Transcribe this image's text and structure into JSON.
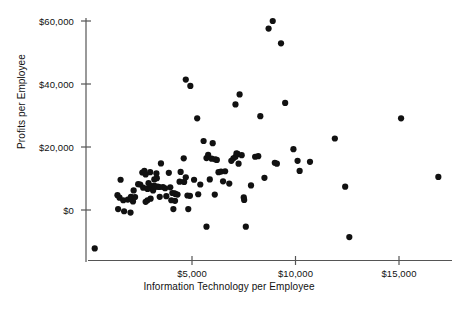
{
  "chart_data": {
    "type": "scatter",
    "title": "",
    "xlabel": "Information Technology per Employee",
    "ylabel": "Profits per Employee",
    "xlim": [
      0,
      18000
    ],
    "ylim": [
      -14000,
      64000
    ],
    "grid": false,
    "legend": null,
    "marker": {
      "shape": "circle",
      "color": "#111111",
      "size": 4.2
    },
    "xticks": [
      5000,
      10000,
      15000
    ],
    "xticklabels": [
      "$5,000",
      "$10,000",
      "$15,000"
    ],
    "yticks": [
      0,
      20000,
      40000,
      60000
    ],
    "yticklabels": [
      "$0",
      "$20,000",
      "$40,000",
      "$60,000"
    ],
    "n_points": 108,
    "points": [
      [
        300,
        -12200
      ],
      [
        1550,
        9600
      ],
      [
        1400,
        4700
      ],
      [
        1500,
        3900
      ],
      [
        1680,
        3100
      ],
      [
        1430,
        300
      ],
      [
        1720,
        -400
      ],
      [
        2030,
        -800
      ],
      [
        1900,
        3300
      ],
      [
        2150,
        2700
      ],
      [
        2180,
        6200
      ],
      [
        2600,
        11900
      ],
      [
        2700,
        12400
      ],
      [
        2760,
        11300
      ],
      [
        2400,
        8200
      ],
      [
        2500,
        8100
      ],
      [
        2640,
        7100
      ],
      [
        2850,
        6700
      ],
      [
        2980,
        6900
      ],
      [
        3050,
        7600
      ],
      [
        3180,
        7700
      ],
      [
        3120,
        6200
      ],
      [
        3000,
        3600
      ],
      [
        2850,
        3100
      ],
      [
        2760,
        2600
      ],
      [
        3180,
        9700
      ],
      [
        3300,
        10100
      ],
      [
        3240,
        7400
      ],
      [
        3350,
        7400
      ],
      [
        3420,
        7300
      ],
      [
        3500,
        14800
      ],
      [
        3600,
        7300
      ],
      [
        3700,
        6900
      ],
      [
        3880,
        11800
      ],
      [
        3950,
        7200
      ],
      [
        4050,
        5400
      ],
      [
        4150,
        5300
      ],
      [
        4200,
        5100
      ],
      [
        4300,
        4900
      ],
      [
        4180,
        2900
      ],
      [
        4000,
        3100
      ],
      [
        4100,
        300
      ],
      [
        4600,
        16400
      ],
      [
        4700,
        10400
      ],
      [
        4620,
        8900
      ],
      [
        4780,
        4600
      ],
      [
        4900,
        4500
      ],
      [
        4820,
        300
      ],
      [
        4700,
        41400
      ],
      [
        4920,
        39400
      ],
      [
        5250,
        29100
      ],
      [
        5400,
        8100
      ],
      [
        5560,
        21900
      ],
      [
        5700,
        16500
      ],
      [
        5780,
        17500
      ],
      [
        5860,
        9700
      ],
      [
        5700,
        -5300
      ],
      [
        6000,
        21200
      ],
      [
        6120,
        16100
      ],
      [
        6200,
        15900
      ],
      [
        6280,
        12000
      ],
      [
        6400,
        12200
      ],
      [
        6100,
        4900
      ],
      [
        6800,
        8400
      ],
      [
        6900,
        15600
      ],
      [
        7000,
        16400
      ],
      [
        7100,
        16900
      ],
      [
        7150,
        18000
      ],
      [
        7200,
        17800
      ],
      [
        7250,
        14700
      ],
      [
        7100,
        33500
      ],
      [
        7300,
        36700
      ],
      [
        7500,
        4000
      ],
      [
        7520,
        3200
      ],
      [
        7600,
        -5300
      ],
      [
        7850,
        7800
      ],
      [
        8200,
        17100
      ],
      [
        8300,
        29800
      ],
      [
        8500,
        10200
      ],
      [
        8700,
        57600
      ],
      [
        8900,
        60000
      ],
      [
        9000,
        15000
      ],
      [
        9100,
        14700
      ],
      [
        9300,
        52900
      ],
      [
        9500,
        34000
      ],
      [
        9900,
        19300
      ],
      [
        10100,
        15600
      ],
      [
        10200,
        12400
      ],
      [
        10700,
        15300
      ],
      [
        11900,
        22700
      ],
      [
        12400,
        7400
      ],
      [
        12600,
        -8600
      ],
      [
        15100,
        29100
      ],
      [
        16900,
        10500
      ],
      [
        2050,
        4200
      ],
      [
        2250,
        4100
      ],
      [
        2900,
        8500
      ],
      [
        3440,
        4200
      ],
      [
        3760,
        4400
      ],
      [
        4450,
        12100
      ],
      [
        5100,
        9600
      ],
      [
        5300,
        5000
      ],
      [
        6500,
        9100
      ],
      [
        6600,
        12300
      ],
      [
        3280,
        11600
      ],
      [
        2980,
        12000
      ],
      [
        4400,
        9000
      ],
      [
        5950,
        16300
      ],
      [
        7400,
        17400
      ],
      [
        8050,
        16900
      ]
    ]
  },
  "axes": {
    "x_axis_name": "x-axis-line",
    "y_axis_name": "y-axis-line"
  }
}
